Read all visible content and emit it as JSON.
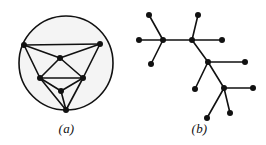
{
  "figure": {
    "background_color": "#ffffff",
    "ink_color": "#111111",
    "circle_fill_color": "#f4f4f4",
    "edge_width": 1.6,
    "node_radius": 3.0,
    "width": 266,
    "height": 145
  },
  "panels": [
    {
      "id": "a",
      "caption": "(a)",
      "kind": "graph-in-circle",
      "description": "planar graph drawn inside a circle"
    },
    {
      "id": "b",
      "caption": "(b)",
      "kind": "tree",
      "description": "free tree with branching internal nodes and leaves"
    }
  ],
  "graph_data": {
    "type": "node-link",
    "panel_a": {
      "circle": {
        "cx": 66,
        "cy": 63,
        "r": 47
      },
      "nodes": [
        {
          "id": "tl",
          "label": "",
          "x": 24,
          "y": 45
        },
        {
          "id": "tr",
          "label": "",
          "x": 100,
          "y": 44
        },
        {
          "id": "c",
          "label": "",
          "x": 60,
          "y": 58
        },
        {
          "id": "ml",
          "label": "",
          "x": 40,
          "y": 78
        },
        {
          "id": "mr",
          "label": "",
          "x": 83,
          "y": 78
        },
        {
          "id": "lo",
          "label": "",
          "x": 61,
          "y": 91
        },
        {
          "id": "b",
          "label": "",
          "x": 66,
          "y": 110
        }
      ],
      "edges": [
        [
          "tl",
          "tr"
        ],
        [
          "tl",
          "c"
        ],
        [
          "tr",
          "c"
        ],
        [
          "tl",
          "ml"
        ],
        [
          "tr",
          "mr"
        ],
        [
          "c",
          "ml"
        ],
        [
          "c",
          "mr"
        ],
        [
          "ml",
          "mr"
        ],
        [
          "ml",
          "lo"
        ],
        [
          "mr",
          "lo"
        ],
        [
          "ml",
          "b"
        ],
        [
          "mr",
          "b"
        ],
        [
          "lo",
          "b"
        ]
      ]
    },
    "panel_b": {
      "nodes": [
        {
          "id": "h1",
          "label": "",
          "x": 30,
          "y": 40,
          "role": "internal"
        },
        {
          "id": "h2",
          "label": "",
          "x": 59,
          "y": 40,
          "role": "internal"
        },
        {
          "id": "h3",
          "label": "",
          "x": 75,
          "y": 62,
          "role": "internal"
        },
        {
          "id": "h4",
          "label": "",
          "x": 91,
          "y": 88,
          "role": "internal"
        },
        {
          "id": "l1",
          "label": "",
          "x": 6,
          "y": 40,
          "role": "leaf"
        },
        {
          "id": "l2",
          "label": "",
          "x": 16,
          "y": 15,
          "role": "leaf"
        },
        {
          "id": "l3",
          "label": "",
          "x": 18,
          "y": 64,
          "role": "leaf"
        },
        {
          "id": "l4",
          "label": "",
          "x": 65,
          "y": 15,
          "role": "leaf"
        },
        {
          "id": "l5",
          "label": "",
          "x": 89,
          "y": 40,
          "role": "leaf"
        },
        {
          "id": "l6",
          "label": "",
          "x": 112,
          "y": 62,
          "role": "leaf"
        },
        {
          "id": "l7",
          "label": "",
          "x": 62,
          "y": 89,
          "role": "leaf"
        },
        {
          "id": "l8",
          "label": "",
          "x": 120,
          "y": 88,
          "role": "leaf"
        },
        {
          "id": "l9",
          "label": "",
          "x": 97,
          "y": 113,
          "role": "leaf"
        },
        {
          "id": "l10",
          "label": "",
          "x": 74,
          "y": 118,
          "role": "leaf"
        }
      ],
      "edges": [
        [
          "h1",
          "l1"
        ],
        [
          "h1",
          "l2"
        ],
        [
          "h1",
          "l3"
        ],
        [
          "h1",
          "h2"
        ],
        [
          "h2",
          "l4"
        ],
        [
          "h2",
          "l5"
        ],
        [
          "h2",
          "h3"
        ],
        [
          "h3",
          "l6"
        ],
        [
          "h3",
          "l7"
        ],
        [
          "h3",
          "h4"
        ],
        [
          "h4",
          "l8"
        ],
        [
          "h4",
          "l9"
        ],
        [
          "h4",
          "l10"
        ]
      ]
    }
  }
}
